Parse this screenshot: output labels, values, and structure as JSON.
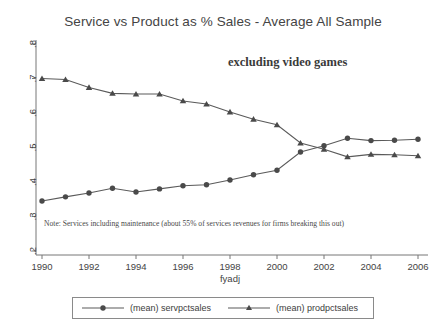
{
  "chart_data": {
    "type": "line",
    "title": "Service vs Product as % Sales - Average All Sample",
    "xlabel": "fyadj",
    "ylabel": "",
    "xlim": [
      1990,
      2006
    ],
    "ylim": [
      0.2,
      0.8
    ],
    "grid": false,
    "legend_position": "below",
    "xticks": [
      1990,
      1992,
      1994,
      1996,
      1998,
      2000,
      2002,
      2004,
      2006
    ],
    "xtick_labels": [
      "1990",
      "1992",
      "1994",
      "1996",
      "1998",
      "2000",
      "2002",
      "2004",
      "2006"
    ],
    "yticks": [
      0.2,
      0.3,
      0.4,
      0.5,
      0.6,
      0.7,
      0.8
    ],
    "ytick_labels": [
      ".2",
      ".3",
      ".4",
      ".5",
      ".6",
      ".7",
      ".8"
    ],
    "x": [
      1990,
      1991,
      1992,
      1993,
      1994,
      1995,
      1996,
      1997,
      1998,
      1999,
      2000,
      2001,
      2002,
      2003,
      2004,
      2005,
      2006
    ],
    "series": [
      {
        "name": "(mean) servpctsales",
        "marker": "circle",
        "color": "#4a4a4a",
        "values": [
          0.345,
          0.357,
          0.368,
          0.382,
          0.371,
          0.38,
          0.389,
          0.392,
          0.406,
          0.421,
          0.434,
          0.487,
          0.505,
          0.527,
          0.52,
          0.521,
          0.524
        ]
      },
      {
        "name": "(mean) prodpctsales",
        "marker": "triangle",
        "color": "#4a4a4a",
        "values": [
          0.7,
          0.697,
          0.674,
          0.657,
          0.655,
          0.655,
          0.635,
          0.626,
          0.603,
          0.582,
          0.566,
          0.513,
          0.495,
          0.473,
          0.48,
          0.479,
          0.476
        ]
      }
    ],
    "annotations": [
      {
        "name": "excluding-video-games",
        "text": "excluding video games"
      },
      {
        "name": "note",
        "text": "Note: Services including maintenance  (about 55% of services revenues for firms breaking this out)"
      }
    ]
  },
  "legend": {
    "entries": [
      {
        "label": "(mean) servpctsales",
        "marker": "circle"
      },
      {
        "label": "(mean) prodpctsales",
        "marker": "triangle"
      }
    ]
  }
}
